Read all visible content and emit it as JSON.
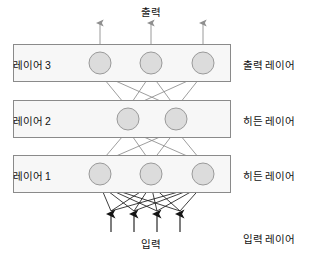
{
  "diagram": {
    "title_visible": false,
    "colors": {
      "node_fill": "#dcdcdc",
      "node_stroke": "#9a9a9a",
      "box_fill": "#f7f7f7",
      "box_stroke": "#8a8a8a",
      "edge_stroke": "#808080",
      "input_edge_stroke": "#1a1a1a",
      "arrow_fill": "#1a1a1a",
      "text": "#111111",
      "background": "#ffffff"
    },
    "top_flow_label": "출력",
    "bottom_flow_label": "입력",
    "layers": [
      {
        "id": "layer-3",
        "box_label": "레이어 3",
        "side_label": "출력 레이어",
        "node_count": 3,
        "box": {
          "x": 13,
          "y": 44,
          "w": 218,
          "h": 38
        },
        "node_y": 63,
        "node_x": [
          100,
          151,
          203
        ],
        "node_r": 11
      },
      {
        "id": "layer-2",
        "box_label": "레이어 2",
        "side_label": "히든 레이어",
        "node_count": 2,
        "box": {
          "x": 13,
          "y": 100,
          "w": 218,
          "h": 38
        },
        "node_y": 119,
        "node_x": [
          128,
          176
        ],
        "node_r": 11
      },
      {
        "id": "layer-1",
        "box_label": "레이어 1",
        "side_label": "히든 레이어",
        "node_count": 3,
        "box": {
          "x": 13,
          "y": 155,
          "w": 218,
          "h": 38
        },
        "node_y": 174,
        "node_x": [
          100,
          151,
          203
        ],
        "node_r": 11
      },
      {
        "id": "input-layer",
        "box_label": "",
        "side_label": "입력 레이어",
        "node_count": 4,
        "input_x": [
          111,
          134,
          157,
          180
        ],
        "arrow_tip_y": 211,
        "arrow_tail_y": 232
      }
    ],
    "output_arrows": {
      "x": [
        100,
        151,
        203
      ],
      "tip_y": 20,
      "tail_y": 44
    },
    "label_positions": {
      "top_flow": {
        "x": 124,
        "y": 4,
        "w": 54
      },
      "bottom_flow": {
        "x": 124,
        "y": 236,
        "w": 54
      },
      "layer3_box_label_y": 57,
      "layer2_box_label_y": 113,
      "layer1_box_label_y": 168,
      "layer3_side_label_y": 57,
      "layer2_side_label_y": 113,
      "layer1_side_label_y": 168,
      "input_side_label_y": 231
    }
  }
}
